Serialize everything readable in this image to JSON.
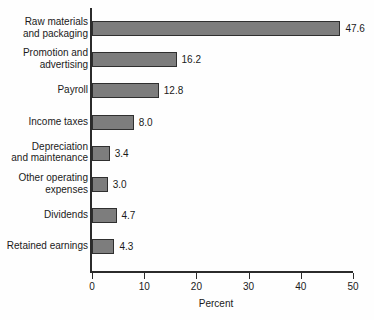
{
  "chart_data": {
    "type": "bar",
    "orientation": "horizontal",
    "title": "",
    "subtitle": "",
    "xlabel": "Percent",
    "ylabel": "",
    "xlim": [
      0,
      50
    ],
    "xticks": [
      0,
      10,
      20,
      30,
      40,
      50
    ],
    "xtick_labels": [
      "0",
      "10",
      "20",
      "30",
      "40",
      "50"
    ],
    "grid": false,
    "legend": null,
    "bar_color": "#7d7d7d",
    "bar_edge_color": "#2f2f2f",
    "axis_color": "#2b2b2b",
    "background_color": "#ffffff",
    "categories": [
      "Raw materials\nand packaging",
      "Promotion and\nadvertising",
      "Payroll",
      "Income taxes",
      "Depreciation\nand maintenance",
      "Other operating\nexpenses",
      "Dividends",
      "Retained earnings"
    ],
    "values": [
      47.6,
      16.2,
      12.8,
      8.0,
      3.4,
      3.0,
      4.7,
      4.3
    ],
    "value_labels": [
      "47.6",
      "16.2",
      "12.8",
      "8.0",
      "3.4",
      "3.0",
      "4.7",
      "4.3"
    ],
    "bars": [
      {
        "label": "Raw materials\nand packaging",
        "value": 47.6,
        "value_label": "47.6",
        "label_lines": 2
      },
      {
        "label": "Promotion and\nadvertising",
        "value": 16.2,
        "value_label": "16.2",
        "label_lines": 2
      },
      {
        "label": "Payroll",
        "value": 12.8,
        "value_label": "12.8",
        "label_lines": 1
      },
      {
        "label": "Income taxes",
        "value": 8.0,
        "value_label": "8.0",
        "label_lines": 1
      },
      {
        "label": "Depreciation\nand maintenance",
        "value": 3.4,
        "value_label": "3.4",
        "label_lines": 2
      },
      {
        "label": "Other operating\nexpenses",
        "value": 3.0,
        "value_label": "3.0",
        "label_lines": 2
      },
      {
        "label": "Dividends",
        "value": 4.7,
        "value_label": "4.7",
        "label_lines": 1
      },
      {
        "label": "Retained earnings",
        "value": 4.3,
        "value_label": "4.3",
        "label_lines": 1
      }
    ]
  }
}
